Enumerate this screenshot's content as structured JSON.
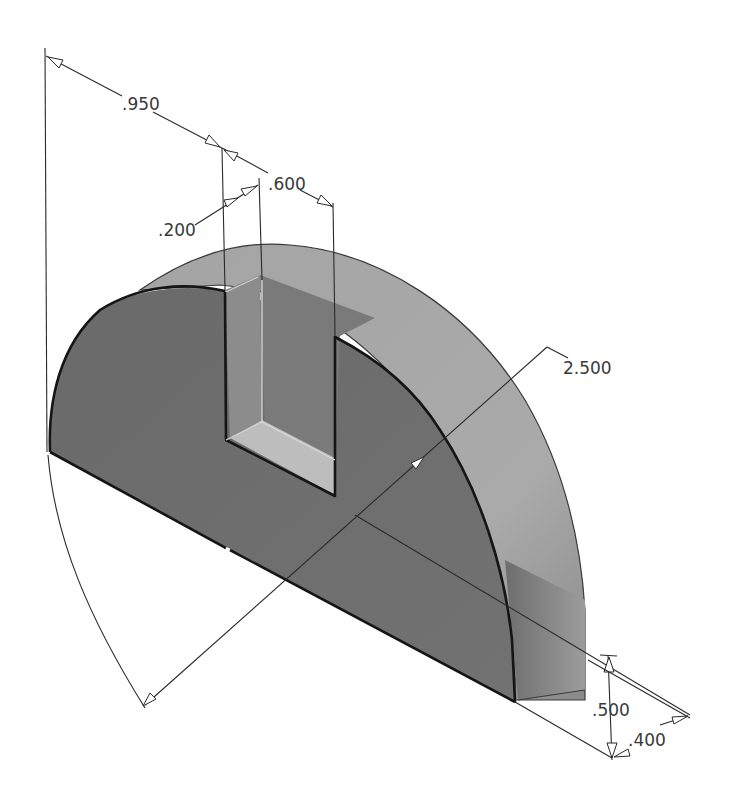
{
  "drawing": {
    "type": "isometric dimensioned part drawing",
    "part": "half-disc block with rectangular slot",
    "colors": {
      "background": "#ffffff",
      "front_face": "#6e6e6e",
      "top_curved_face": "#a9a9a9",
      "slot_back_wall": "#787878",
      "slot_floor": "#b8b8b8",
      "right_end_face": "#808080",
      "dimension_lines": "#2a2a2a",
      "dimension_text": "#3a3a3a"
    },
    "dimensions": [
      {
        "id": "slot-offset",
        "label": ".950"
      },
      {
        "id": "slot-width",
        "label": ".600"
      },
      {
        "id": "slot-depth",
        "label": ".200"
      },
      {
        "id": "radius",
        "label": "2.500"
      },
      {
        "id": "thickness",
        "label": ".500"
      },
      {
        "id": "flat-depth",
        "label": ".400"
      }
    ]
  }
}
